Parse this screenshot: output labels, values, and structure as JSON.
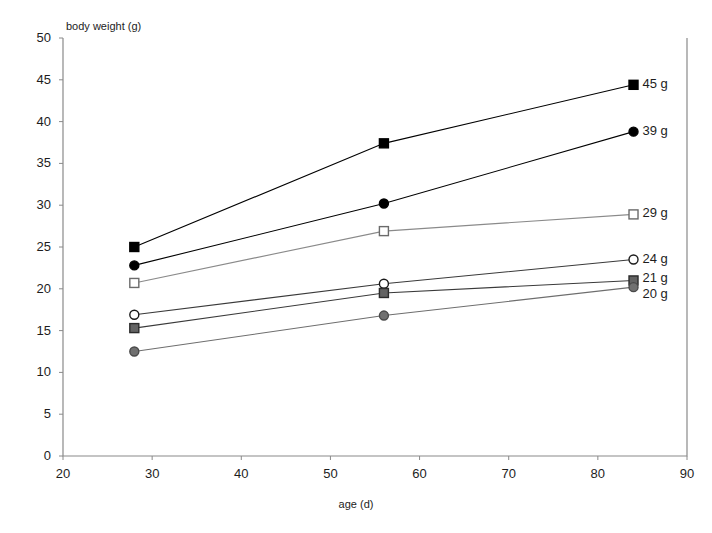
{
  "chart_data": {
    "type": "line",
    "title": "",
    "xlabel": "age (d)",
    "ylabel": "body weight (g)",
    "x": [
      28,
      56,
      84
    ],
    "xlim": [
      20,
      90
    ],
    "ylim": [
      0,
      50
    ],
    "xticks": [
      "20",
      "30",
      "40",
      "50",
      "60",
      "70",
      "80",
      "90"
    ],
    "yticks": [
      "0",
      "5",
      "10",
      "15",
      "20",
      "25",
      "30",
      "35",
      "40",
      "45",
      "50"
    ],
    "grid": false,
    "legend_position": "right-inline-labels",
    "series": [
      {
        "name": "45 g",
        "label": "45 g",
        "marker": "filled-square",
        "color": "#000000",
        "fill": "#000000",
        "line_color": "#000000",
        "values": [
          25.0,
          37.4,
          44.4
        ]
      },
      {
        "name": "39 g",
        "label": "39 g",
        "marker": "filled-circle",
        "color": "#000000",
        "fill": "#000000",
        "line_color": "#000000",
        "values": [
          22.8,
          30.2,
          38.8
        ]
      },
      {
        "name": "29 g",
        "label": "29 g",
        "marker": "open-square",
        "color": "#6b6b6b",
        "fill": "#ffffff",
        "line_color": "#8a8a8a",
        "values": [
          20.7,
          26.9,
          28.9
        ]
      },
      {
        "name": "24 g",
        "label": "24 g",
        "marker": "open-circle",
        "color": "#1a1a1a",
        "fill": "#ffffff",
        "line_color": "#3a3a3a",
        "values": [
          16.9,
          20.6,
          23.5
        ]
      },
      {
        "name": "21 g",
        "label": "21 g",
        "marker": "gray-square",
        "color": "#2b2b2b",
        "fill": "#636363",
        "line_color": "#3a3a3a",
        "values": [
          15.3,
          19.5,
          21.0
        ]
      },
      {
        "name": "20 g",
        "label": "20 g",
        "marker": "gray-circle",
        "color": "#4a4a4a",
        "fill": "#707070",
        "line_color": "#6e6e6e",
        "values": [
          12.5,
          16.8,
          20.2
        ]
      }
    ]
  },
  "axes": {
    "y_title": "body weight (g)",
    "x_title": "age (d)"
  }
}
